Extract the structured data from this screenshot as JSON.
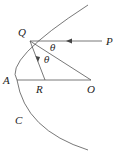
{
  "diagram": {
    "points": {
      "Q": {
        "label": "Q",
        "x": 30,
        "y": 41
      },
      "P": {
        "label": "P",
        "x": 106,
        "y": 41
      },
      "A": {
        "label": "A",
        "x": 17,
        "y": 80
      },
      "R": {
        "label": "R",
        "x": 45,
        "y": 80
      },
      "O": {
        "label": "O",
        "x": 91,
        "y": 80
      },
      "C": {
        "label": "C"
      }
    },
    "angles": {
      "theta1": "θ",
      "theta2": "θ"
    },
    "stroke_color": "#555555"
  }
}
